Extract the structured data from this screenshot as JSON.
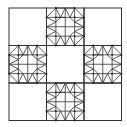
{
  "diagram": {
    "grid": {
      "rows": 3,
      "cols": 3
    },
    "stroke_color": "#333333",
    "background": "#ffffff",
    "patterned_cells": [
      {
        "row": 0,
        "col": 1
      },
      {
        "row": 1,
        "col": 0
      },
      {
        "row": 1,
        "col": 2
      },
      {
        "row": 2,
        "col": 1
      }
    ],
    "plain_cells": [
      {
        "row": 0,
        "col": 0
      },
      {
        "row": 0,
        "col": 2
      },
      {
        "row": 1,
        "col": 1
      },
      {
        "row": 2,
        "col": 0
      },
      {
        "row": 2,
        "col": 2
      }
    ]
  }
}
